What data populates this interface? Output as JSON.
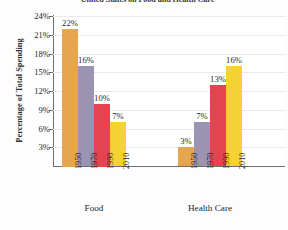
{
  "chart_data": {
    "type": "bar",
    "title": "United States on Food and Health Care",
    "xlabel": "",
    "ylabel": "Percentage of Total Spending",
    "ylim": [
      0,
      24
    ],
    "grid": true,
    "legend": "none",
    "ytick_labels": [
      "24%",
      "21%",
      "18%",
      "15%",
      "12%",
      "9%",
      "6%",
      "3%"
    ],
    "ytick_values": [
      24,
      21,
      18,
      15,
      12,
      9,
      6,
      3
    ],
    "categories": [
      "1950",
      "1970",
      "1990",
      "2010"
    ],
    "groups": [
      {
        "name": "Food",
        "values": [
          22,
          16,
          10,
          7
        ],
        "value_labels": [
          "22%",
          "16%",
          "10%",
          "7%"
        ]
      },
      {
        "name": "Health Care",
        "values": [
          3,
          7,
          13,
          16
        ],
        "value_labels": [
          "3%",
          "7%",
          "13%",
          "16%"
        ]
      }
    ],
    "series_colors": [
      "#e6a54f",
      "#9a94b2",
      "#e34450",
      "#f5d233"
    ]
  }
}
